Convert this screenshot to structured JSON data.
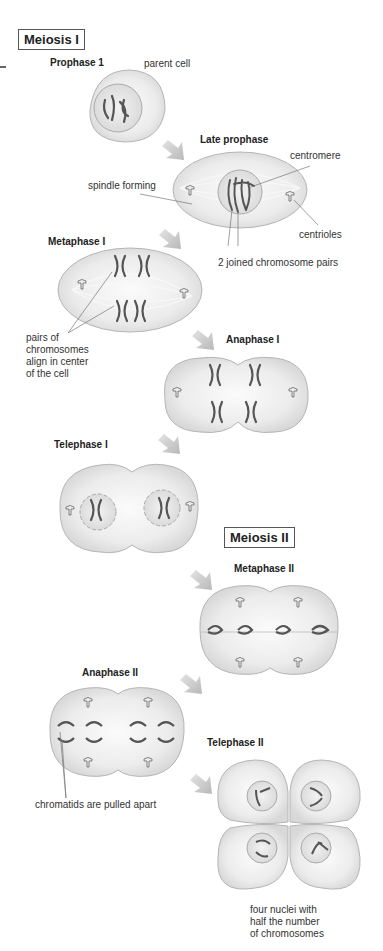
{
  "sections": {
    "meiosis1": "Meiosis I",
    "meiosis2": "Meiosis II"
  },
  "stages": {
    "prophase1": "Prophase 1",
    "late_prophase": "Late prophase",
    "metaphase1": "Metaphase I",
    "anaphase1": "Anaphase I",
    "telephase1": "Telephase I",
    "metaphase2": "Metaphase II",
    "anaphase2": "Anaphase II",
    "telephase2": "Telephase II"
  },
  "labels": {
    "parent_cell": "parent cell",
    "centromere": "centromere",
    "spindle_forming": "spindle forming",
    "centrioles": "centrioles",
    "joined_pairs": "2 joined chromosome pairs",
    "align_center": [
      "pairs of",
      "chromosomes",
      "align in center",
      "of the cell"
    ],
    "chromatids": "chromatids are pulled apart",
    "four_nuclei": [
      "four nuclei with",
      "half the number",
      "of chromosomes"
    ]
  },
  "colors": {
    "cell_fill": "#e6e6e6",
    "cell_stroke": "#b5b5b5",
    "chromosome": "#555555",
    "arrow": "#c8c8c8"
  }
}
